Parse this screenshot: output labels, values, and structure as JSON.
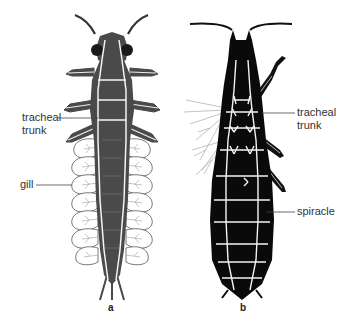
{
  "figure": {
    "panels": [
      {
        "id": "a",
        "letter": "a",
        "description": "aquatic insect larva with tracheal gills",
        "labels": [
          {
            "text_line1": "tracheal",
            "text_line2": "trunk"
          },
          {
            "text_line1": "gill"
          }
        ]
      },
      {
        "id": "b",
        "letter": "b",
        "description": "terrestrial insect with spiracles",
        "labels": [
          {
            "text_line1": "tracheal",
            "text_line2": "trunk"
          },
          {
            "text_line1": "spiracle"
          }
        ]
      }
    ],
    "colors": {
      "larva_body": "#4a4a4a",
      "insect_body": "#0a0a0a",
      "trachea": "#f4f4f4",
      "gill_outline": "#555555",
      "leader_line": "#444444"
    }
  }
}
